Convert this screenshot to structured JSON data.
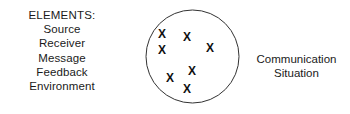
{
  "diagram": {
    "background_color": "#ffffff",
    "stroke_color": "#333333",
    "text_color": "#1a1a1a",
    "elements_list": {
      "heading": "ELEMENTS:",
      "items": [
        "Source",
        "Receiver",
        "Message",
        "Feedback",
        "Environment"
      ]
    },
    "circle": {
      "label_line1": "Communication",
      "label_line2": "Situation",
      "marks": [
        {
          "glyph": "X",
          "x": 17,
          "y": 25
        },
        {
          "glyph": "X",
          "x": 42,
          "y": 28
        },
        {
          "glyph": "X",
          "x": 65,
          "y": 39
        },
        {
          "glyph": "X",
          "x": 17,
          "y": 41
        },
        {
          "glyph": "X",
          "x": 47,
          "y": 62
        },
        {
          "glyph": "X",
          "x": 25,
          "y": 69
        },
        {
          "glyph": "X",
          "x": 42,
          "y": 80
        }
      ]
    }
  }
}
